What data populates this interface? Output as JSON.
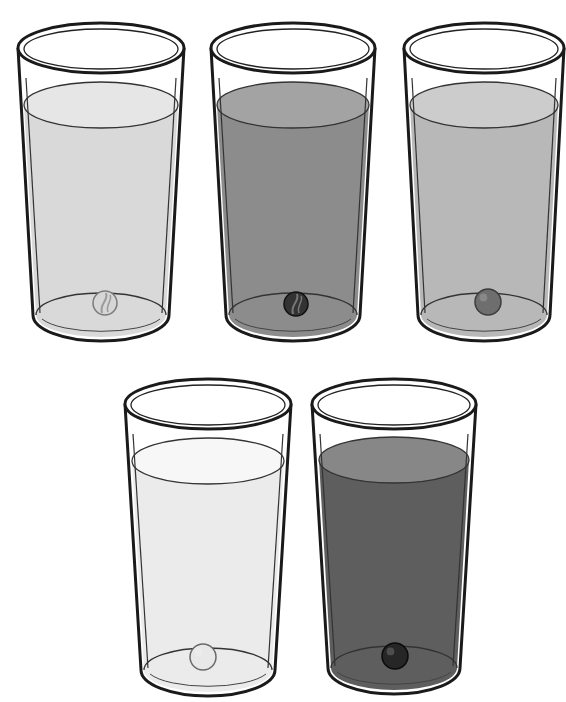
{
  "scene": {
    "description": "Five drinking glasses filled with liquids of different shades, each containing a marble resting at the bottom",
    "background": "#ffffff",
    "outline_color": "#1a1a1a"
  },
  "glasses": [
    {
      "id": "glass-1",
      "cx": 101,
      "rim_cy": 48,
      "rim_rx": 83,
      "rim_ry": 25,
      "bottom_cy": 315,
      "bottom_rx": 65,
      "bottom_ry": 22,
      "liquid_cy": 105,
      "liquid_rx": 77,
      "liquid_ry": 23,
      "liquid_color": "#d9d9d9",
      "liquid_top_color": "#e6e6e6",
      "marble": {
        "cx": 105,
        "cy": 303,
        "r": 12,
        "fill": "#d6d6d6",
        "stroke": "#7a7a7a",
        "style": "swirl"
      }
    },
    {
      "id": "glass-2",
      "cx": 293,
      "rim_cy": 48,
      "rim_rx": 82,
      "rim_ry": 25,
      "bottom_cy": 315,
      "bottom_rx": 64,
      "bottom_ry": 22,
      "liquid_cy": 105,
      "liquid_rx": 76,
      "liquid_ry": 23,
      "liquid_color": "#8c8c8c",
      "liquid_top_color": "#a3a3a3",
      "marble": {
        "cx": 296,
        "cy": 304,
        "r": 12,
        "fill": "#333333",
        "stroke": "#111111",
        "style": "swirl"
      }
    },
    {
      "id": "glass-3",
      "cx": 484,
      "rim_cy": 48,
      "rim_rx": 80,
      "rim_ry": 25,
      "bottom_cy": 315,
      "bottom_rx": 63,
      "bottom_ry": 22,
      "liquid_cy": 105,
      "liquid_rx": 74,
      "liquid_ry": 23,
      "liquid_color": "#b8b8b8",
      "liquid_top_color": "#cccccc",
      "marble": {
        "cx": 488,
        "cy": 302,
        "r": 13,
        "fill": "#6e6e6e",
        "stroke": "#3c3c3c",
        "style": "solid"
      }
    },
    {
      "id": "glass-4",
      "cx": 208,
      "rim_cy": 404,
      "rim_rx": 83,
      "rim_ry": 25,
      "bottom_cy": 670,
      "bottom_rx": 64,
      "bottom_ry": 22,
      "liquid_cy": 461,
      "liquid_rx": 76,
      "liquid_ry": 23,
      "liquid_color": "#ebebeb",
      "liquid_top_color": "#f7f7f7",
      "marble": {
        "cx": 203,
        "cy": 657,
        "r": 13,
        "fill": "#e8e8e8",
        "stroke": "#6a6a6a",
        "style": "solid"
      }
    },
    {
      "id": "glass-5",
      "cx": 394,
      "rim_cy": 404,
      "rim_rx": 82,
      "rim_ry": 25,
      "bottom_cy": 668,
      "bottom_rx": 63,
      "bottom_ry": 22,
      "liquid_cy": 460,
      "liquid_rx": 75,
      "liquid_ry": 23,
      "liquid_color": "#5e5e5e",
      "liquid_top_color": "#878787",
      "marble": {
        "cx": 395,
        "cy": 656,
        "r": 13,
        "fill": "#262626",
        "stroke": "#0a0a0a",
        "style": "solid"
      }
    }
  ]
}
